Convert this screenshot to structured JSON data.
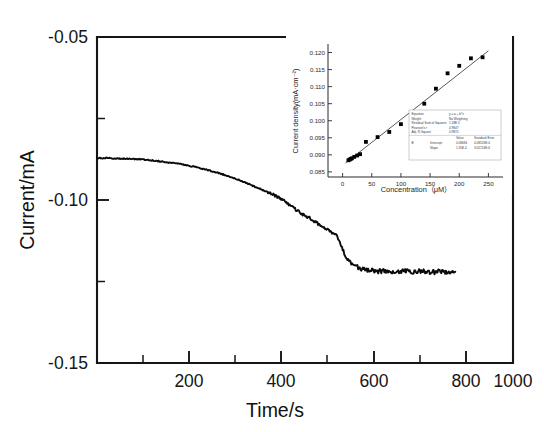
{
  "figure": {
    "background_color": "#ffffff",
    "line_color": "#0b0b0b",
    "marker_color": "#000000"
  },
  "chart_data": {
    "type": "line",
    "title": "",
    "xlabel": "Time/s",
    "ylabel": "Current/mA",
    "xlim": [
      100,
      1000
    ],
    "ylim": [
      -0.15,
      -0.05
    ],
    "grid": false,
    "legend": null,
    "x_ticks": [
      200,
      400,
      600,
      800,
      1000
    ],
    "x_tick_labels": [
      "200",
      "400",
      "600",
      "800",
      "1000"
    ],
    "x_minor_ticks": [
      100,
      300,
      500,
      700,
      900
    ],
    "y_ticks": [
      -0.05,
      -0.1,
      -0.15
    ],
    "y_tick_labels": [
      "-0.05",
      "-0.10",
      "-0.15"
    ],
    "y_minor_ticks": [
      -0.075,
      -0.125
    ],
    "series": [
      {
        "name": "Amperometric i-t response",
        "description": "Current decreases from about -0.087 mA, declining gradually then stepping down steeply near 500-650 s before levelling off near -0.122 mA with noise.",
        "x": [
          100,
          120,
          140,
          160,
          180,
          200,
          220,
          240,
          260,
          280,
          300,
          320,
          340,
          360,
          380,
          400,
          420,
          440,
          460,
          480,
          500,
          520,
          540,
          560,
          580,
          600,
          620,
          640,
          660,
          680,
          700,
          720,
          740,
          760,
          780,
          800,
          820,
          840,
          860,
          875
        ],
        "y": [
          -0.0872,
          -0.0871,
          -0.0872,
          -0.0873,
          -0.0874,
          -0.0876,
          -0.0879,
          -0.0882,
          -0.0886,
          -0.089,
          -0.0895,
          -0.0901,
          -0.0908,
          -0.0916,
          -0.0925,
          -0.0935,
          -0.0946,
          -0.0958,
          -0.097,
          -0.0983,
          -0.0998,
          -0.1018,
          -0.104,
          -0.1056,
          -0.1075,
          -0.1092,
          -0.1112,
          -0.118,
          -0.1205,
          -0.1214,
          -0.1218,
          -0.1219,
          -0.122,
          -0.1218,
          -0.122,
          -0.1219,
          -0.1221,
          -0.122,
          -0.1219,
          -0.122
        ]
      }
    ],
    "inset": {
      "type": "scatter",
      "title": "",
      "xlabel": "Concentration（μM）",
      "ylabel": "Current density(mA·cm⁻²)",
      "xlim": [
        -25,
        275
      ],
      "ylim": [
        0.0835,
        0.1225
      ],
      "grid": false,
      "x_ticks": [
        0,
        50,
        100,
        150,
        200,
        250
      ],
      "x_tick_labels": [
        "0",
        "50",
        "100",
        "150",
        "200",
        "250"
      ],
      "y_ticks": [
        0.085,
        0.09,
        0.095,
        0.1,
        0.105,
        0.11,
        0.115,
        0.12
      ],
      "y_tick_labels": [
        "0.085",
        "0.090",
        "0.095",
        "0.100",
        "0.105",
        "0.110",
        "0.115",
        "0.120"
      ],
      "points": {
        "x": [
          10,
          12,
          14,
          16,
          20,
          25,
          30,
          40,
          60,
          80,
          100,
          120,
          140,
          160,
          180,
          200,
          220,
          240
        ],
        "y": [
          0.0884,
          0.0886,
          0.0888,
          0.089,
          0.0894,
          0.0898,
          0.0902,
          0.0938,
          0.0952,
          0.0967,
          0.099,
          0.1021,
          0.105,
          0.1094,
          0.1139,
          0.1161,
          0.1183,
          0.1186
        ]
      },
      "fit_line": {
        "name": "Linear fit",
        "x": [
          5,
          250
        ],
        "y": [
          0.0876,
          0.1205
        ]
      },
      "stats_box": {
        "rows": [
          {
            "label": "Equation",
            "value": "y = a + b*x"
          },
          {
            "label": "Weight",
            "value": "No Weighting"
          },
          {
            "label": "Residual Sum of Squares",
            "value": "1.18E-5"
          },
          {
            "label": "Pearson's r",
            "value": "0.9847"
          },
          {
            "label": "Adj. R-Square",
            "value": "0.9870"
          }
        ],
        "table_headers": [
          "",
          "Value",
          "Standard Error"
        ],
        "table_rows": [
          [
            "B",
            "Intercept",
            "0.08684",
            "4.08526E-4"
          ],
          [
            "",
            "Slope",
            "1.35E-4",
            "3.05724E-6"
          ]
        ]
      }
    }
  }
}
